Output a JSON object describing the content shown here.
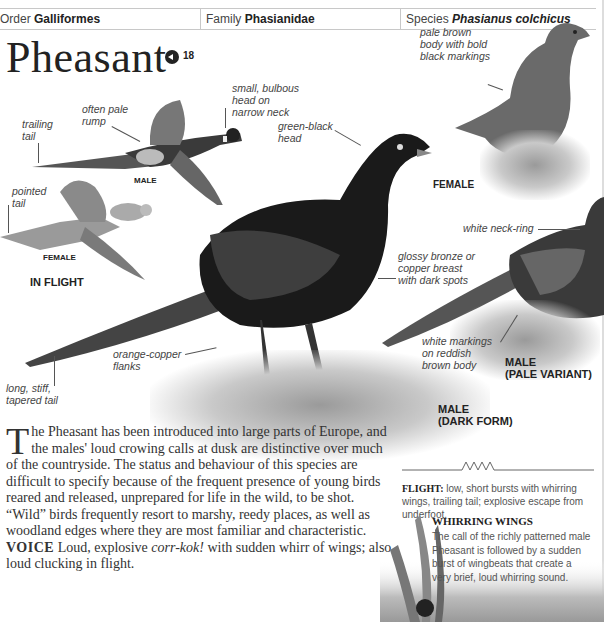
{
  "header": {
    "order_label": "Order",
    "order_value": "Galliformes",
    "family_label": "Family",
    "family_value": "Phasianidae",
    "species_label": "Species",
    "species_value": "Phasianus colchicus"
  },
  "title": "Pheasant",
  "audio": {
    "icon": "speaker-icon",
    "track": "18"
  },
  "annotations": {
    "trailing_tail": [
      "trailing",
      "tail"
    ],
    "pale_rump": [
      "often pale",
      "rump"
    ],
    "small_head": [
      "small, bulbous",
      "head on",
      "narrow neck"
    ],
    "green_black_head": [
      "green-black",
      "head"
    ],
    "pointed_tail": [
      "pointed",
      "tail"
    ],
    "female_body": [
      "pale brown",
      "body with bold",
      "black markings"
    ],
    "white_neck_ring": "white neck-ring",
    "glossy_breast": [
      "glossy bronze or",
      "copper breast",
      "with dark spots"
    ],
    "white_markings": [
      "white markings",
      "on reddish",
      "brown body"
    ],
    "orange_flanks": [
      "orange-copper",
      "flanks"
    ],
    "long_tail": [
      "long, stiff,",
      "tapered tail"
    ]
  },
  "captions": {
    "flight_male": "MALE",
    "flight_female": "FEMALE",
    "in_flight": "IN FLIGHT",
    "female": "FEMALE",
    "male_pale_1": "MALE",
    "male_pale_2": "(PALE VARIANT)",
    "male_dark_1": "MALE",
    "male_dark_2": "(DARK FORM)"
  },
  "body": {
    "dropcap": "T",
    "intro": "he Pheasant has been introduced into large parts of Europe, and the males' loud crowing calls at dusk are distinctive over much of the countryside. The status and behaviour of this species are difficult to specify because of the frequent presence of young birds reared and released, unprepared for life in the wild, to be shot. “Wild” birds frequently resort to marshy, reedy places, as well as woodland edges where they are most familiar and characteristic.",
    "voice_label": "VOICE",
    "voice_text_1": " Loud, explosive ",
    "voice_call": "corr-kok!",
    "voice_text_2": " with sudden whirr of wings; also loud clucking in flight."
  },
  "flight": {
    "label": "FLIGHT:",
    "text": " low, short bursts with whirring wings, trailing tail; explosive escape from underfoot."
  },
  "whirring": {
    "title": "WHIRRING WINGS",
    "text": "The call of the richly patterned male Pheasant is followed by a sudden burst of wingbeats that create a very brief, loud whirring sound."
  }
}
